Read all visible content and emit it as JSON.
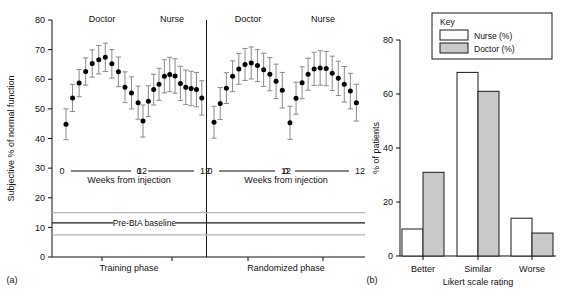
{
  "figure": {
    "panel_a_label": "(a)",
    "panel_b_label": "(b)"
  },
  "panel_a": {
    "ylabel": "Subjective % of normal function",
    "yticks": [
      "0",
      "10",
      "20",
      "30",
      "40",
      "50",
      "60",
      "70",
      "80"
    ],
    "ylim": [
      0,
      80
    ],
    "xaxis_label": "Weeks from injection",
    "xtick_start": "0",
    "xtick_end": "12",
    "baseline_label": "Pre-BtA baseline",
    "baseline_value": 11.5,
    "baseline_band_upper": 15.0,
    "baseline_band_lower": 7.5,
    "phases": [
      {
        "name": "Training phase",
        "groups": [
          "Doctor",
          "Nurse"
        ]
      },
      {
        "name": "Randomized phase",
        "groups": [
          "Doctor",
          "Nurse"
        ]
      }
    ],
    "marker_color": "#000000",
    "errorbar_color": "#8a8a8a"
  },
  "panel_b": {
    "ylabel": "% of patients",
    "xlabel": "Likert scale rating",
    "yticks": [
      "0",
      "20",
      "40",
      "60",
      "80"
    ],
    "ylim": [
      0,
      80
    ],
    "key_title": "Key",
    "key_items": [
      {
        "label": "Nurse (%)",
        "fill": "#ffffff"
      },
      {
        "label": "Doctor (%)",
        "fill": "#c9c9c9"
      }
    ]
  },
  "chart_data": [
    {
      "type": "scatter",
      "id": "panel-a-training-doctor",
      "title": "Doctor",
      "phase": "Training phase",
      "xlabel": "Weeks from injection",
      "ylabel": "Subjective % of normal function",
      "ylim": [
        0,
        80
      ],
      "xlim": [
        0,
        12
      ],
      "x": [
        0,
        1,
        2,
        3,
        4,
        5,
        6,
        7,
        8,
        9,
        10,
        11,
        12
      ],
      "values": [
        44.8,
        53.7,
        58.7,
        62.6,
        65.3,
        66.6,
        67.4,
        65.2,
        62.5,
        57.3,
        55.4,
        52.1
      ],
      "err_low": [
        5.2,
        4.6,
        4.6,
        4.6,
        4.6,
        4.8,
        4.8,
        4.8,
        5.0,
        5.2,
        5.4,
        5.6
      ],
      "err_high": [
        5.2,
        4.6,
        4.6,
        4.6,
        4.6,
        4.8,
        4.8,
        4.8,
        5.0,
        5.2,
        5.4,
        5.6
      ]
    },
    {
      "type": "scatter",
      "id": "panel-a-training-nurse",
      "title": "Nurse",
      "phase": "Training phase",
      "xlabel": "Weeks from injection",
      "ylabel": "Subjective % of normal function",
      "ylim": [
        0,
        80
      ],
      "xlim": [
        0,
        12
      ],
      "x": [
        0,
        1,
        2,
        3,
        4,
        5,
        6,
        7,
        8,
        9,
        10,
        11
      ],
      "values": [
        45.9,
        52.6,
        56.5,
        58.3,
        61.0,
        61.6,
        61.1,
        58.6,
        57.3,
        56.9,
        56.5,
        53.7
      ],
      "err_low": [
        5.4,
        5.2,
        5.2,
        5.4,
        5.6,
        5.8,
        5.8,
        5.8,
        5.8,
        5.8,
        5.8,
        5.8
      ],
      "err_high": [
        5.4,
        5.2,
        5.2,
        5.4,
        5.6,
        5.8,
        5.8,
        5.8,
        5.8,
        5.8,
        5.8,
        5.8
      ]
    },
    {
      "type": "scatter",
      "id": "panel-a-randomized-doctor",
      "title": "Doctor",
      "phase": "Randomized phase",
      "xlabel": "Weeks from injection",
      "ylabel": "Subjective % of normal function",
      "ylim": [
        0,
        80
      ],
      "xlim": [
        0,
        12
      ],
      "x": [
        0,
        1,
        2,
        3,
        4,
        5,
        6,
        7,
        8,
        9,
        10,
        11
      ],
      "values": [
        45.5,
        51.8,
        57.0,
        61.0,
        63.5,
        65.0,
        65.5,
        64.6,
        63.2,
        61.7,
        59.3,
        56.3
      ],
      "err_low": [
        5.4,
        5.4,
        5.2,
        5.2,
        5.2,
        5.4,
        5.4,
        5.4,
        5.6,
        5.6,
        5.8,
        6.0
      ],
      "err_high": [
        5.4,
        5.4,
        5.2,
        5.2,
        5.2,
        5.4,
        5.4,
        5.4,
        5.6,
        5.6,
        5.8,
        6.0
      ]
    },
    {
      "type": "scatter",
      "id": "panel-a-randomized-nurse",
      "title": "Nurse",
      "phase": "Randomized phase",
      "xlabel": "Weeks from injection",
      "ylabel": "Subjective % of normal function",
      "ylim": [
        0,
        80
      ],
      "xlim": [
        0,
        12
      ],
      "x": [
        0,
        1,
        2,
        3,
        4,
        5,
        6,
        7,
        8,
        9,
        10,
        11
      ],
      "values": [
        45.3,
        53.6,
        58.8,
        61.7,
        63.5,
        63.8,
        63.6,
        62.0,
        60.3,
        58.3,
        56.0,
        52.1
      ],
      "err_low": [
        5.6,
        5.4,
        5.4,
        5.4,
        5.6,
        5.8,
        5.8,
        5.8,
        5.8,
        6.0,
        6.0,
        6.2
      ],
      "err_high": [
        5.6,
        5.4,
        5.4,
        5.4,
        5.6,
        5.8,
        5.8,
        5.8,
        5.8,
        6.0,
        6.0,
        6.2
      ]
    },
    {
      "type": "bar",
      "id": "panel-b-likert",
      "title": "",
      "categories": [
        "Better",
        "Similar",
        "Worse"
      ],
      "series": [
        {
          "name": "Nurse (%)",
          "values": [
            10,
            68,
            14
          ],
          "fill": "#ffffff"
        },
        {
          "name": "Doctor (%)",
          "values": [
            31,
            61,
            8.5
          ],
          "fill": "#c9c9c9"
        }
      ],
      "xlabel": "Likert scale rating",
      "ylabel": "% of patients",
      "ylim": [
        0,
        80
      ],
      "grid": false,
      "legend_position": "top-right"
    }
  ]
}
